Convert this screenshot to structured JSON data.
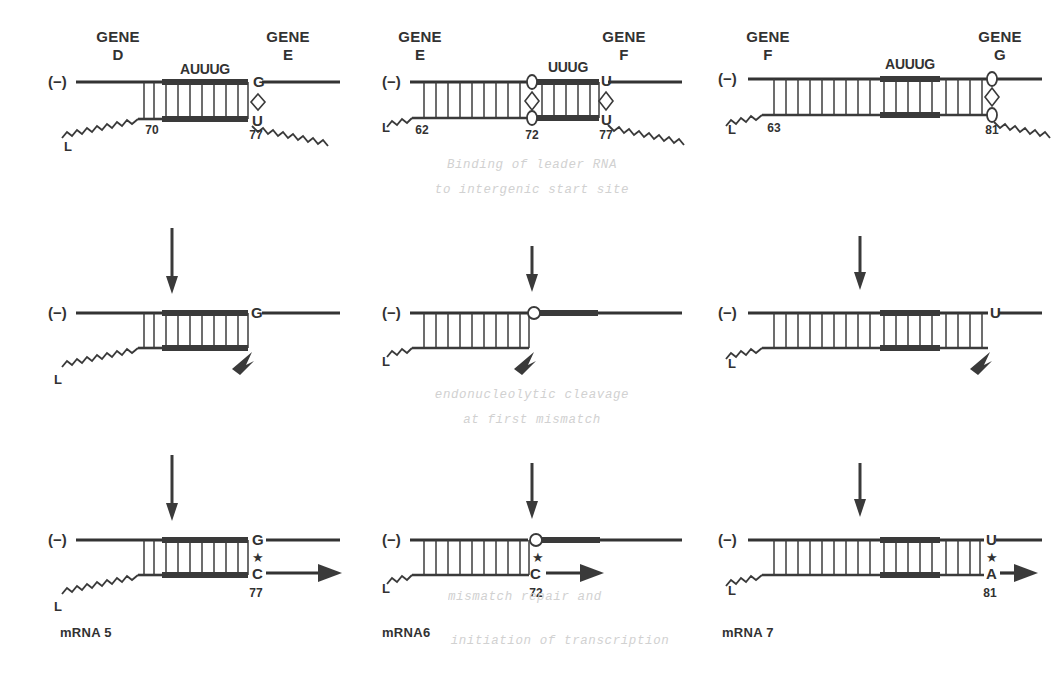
{
  "figure": {
    "minus_strand_label": "(−)",
    "leader_label": "L",
    "star_symbol": "★",
    "rows": [
      "binding",
      "cleavage",
      "initiation"
    ]
  },
  "captions": {
    "row1_line1": "Binding of leader RNA",
    "row1_line2": "to intergenic start site",
    "row2_line1": "endonucleolytic cleavage",
    "row2_line2": "at first mismatch",
    "row3_line1": "mismatch repair and",
    "row3_line2": "initiation of transcription"
  },
  "columns": [
    {
      "id": "col-de",
      "gene_left_word": "GENE",
      "gene_left_letter": "D",
      "gene_right_word": "GENE",
      "gene_right_letter": "E",
      "sequence": "AUUUG",
      "duplex_start_number": "70",
      "mismatch_number": "77",
      "top_base": "G",
      "bottom_base": "U",
      "repaired_top_base": "G",
      "repaired_bottom_base": "C",
      "repaired_number": "77",
      "mrna_label": "mRNA 5"
    },
    {
      "id": "col-ef",
      "gene_left_word": "GENE",
      "gene_left_letter": "E",
      "gene_right_word": "GENE",
      "gene_right_letter": "F",
      "sequence": "UUUG",
      "duplex_start_number": "62",
      "inner_number": "72",
      "mismatch_number": "77",
      "inner_top_base": "G",
      "inner_bottom_base": "U",
      "top_base": "U",
      "bottom_base": "U",
      "repaired_top_base": "G",
      "repaired_bottom_base": "C",
      "repaired_number": "72",
      "mrna_label": "mRNA6"
    },
    {
      "id": "col-fg",
      "gene_left_word": "GENE",
      "gene_left_letter": "F",
      "gene_right_word": "GENE",
      "gene_right_letter": "G",
      "sequence": "AUUUG",
      "duplex_start_number": "63",
      "mismatch_number": "81",
      "top_base": "U",
      "bottom_base": "U",
      "repaired_top_base": "U",
      "repaired_bottom_base": "A",
      "repaired_number": "81",
      "mrna_label": "mRNA 7"
    }
  ],
  "colors": {
    "ink": "#3a3a3a",
    "background": "#ffffff",
    "faded_caption": "#cfcfcf"
  }
}
